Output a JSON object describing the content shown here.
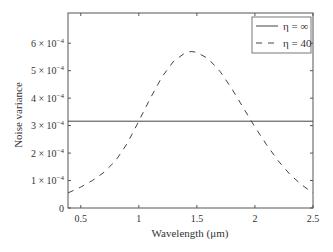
{
  "chart_data": {
    "type": "line",
    "title": "",
    "xlabel": "Wavelength (μm)",
    "ylabel": "Noise variance",
    "xlim": [
      0.39,
      2.5
    ],
    "ylim": [
      0,
      0.00071
    ],
    "grid": false,
    "legend_position": "upper right",
    "x_ticks": [
      0.5,
      1,
      1.5,
      2,
      2.5
    ],
    "x_tick_labels": [
      "0.5",
      "1",
      "1.5",
      "2",
      "2.5"
    ],
    "y_ticks": [
      0,
      0.0001,
      0.0002,
      0.0003,
      0.0004,
      0.0005,
      0.0006
    ],
    "y_tick_labels": [
      {
        "mant": "0",
        "exp": ""
      },
      {
        "mant": "1 × 10",
        "exp": "−4"
      },
      {
        "mant": "2 × 10",
        "exp": "−4"
      },
      {
        "mant": "3 × 10",
        "exp": "−4"
      },
      {
        "mant": "4 × 10",
        "exp": "−4"
      },
      {
        "mant": "5 × 10",
        "exp": "−4"
      },
      {
        "mant": "6 × 10",
        "exp": "−4"
      }
    ],
    "series": [
      {
        "name": "η = ∞",
        "style": "solid",
        "x": [
          0.39,
          2.5
        ],
        "values": [
          0.000316,
          0.000316
        ]
      },
      {
        "name": "η = 40",
        "style": "dashed",
        "x": [
          0.39,
          0.5,
          0.6,
          0.7,
          0.8,
          0.9,
          1.0,
          1.1,
          1.2,
          1.3,
          1.4,
          1.45,
          1.5,
          1.6,
          1.7,
          1.8,
          1.9,
          2.0,
          2.1,
          2.2,
          2.3,
          2.4,
          2.5
        ],
        "values": [
          5.5e-05,
          7.6e-05,
          0.0001,
          0.00013,
          0.000172,
          0.000235,
          0.000316,
          0.0004,
          0.000478,
          0.000535,
          0.000565,
          0.00057,
          0.000567,
          0.000543,
          0.000497,
          0.000435,
          0.000365,
          0.000295,
          0.00023,
          0.000172,
          0.000123,
          8.5e-05,
          5.5e-05
        ]
      }
    ]
  },
  "legend": {
    "items": [
      {
        "label": "η = ∞",
        "style": "solid"
      },
      {
        "label": "η = 40",
        "style": "dashed"
      }
    ]
  }
}
